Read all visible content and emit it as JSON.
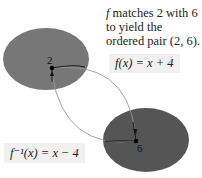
{
  "caption": {
    "f_symbol": "f",
    "text": " matches 2 with 6 to yield the ordered pair (2,  6)."
  },
  "formulas": {
    "f": "f(x) = x + 4",
    "f_inverse": "f⁻¹(x) = x − 4"
  },
  "domain_set": {
    "label": "2",
    "color": "#777777"
  },
  "range_set": {
    "label": "6",
    "color": "#555555"
  },
  "arrows": [
    {
      "from": "2",
      "to": "6",
      "meaning": "f"
    },
    {
      "from": "6",
      "to": "2",
      "meaning": "f inverse"
    }
  ],
  "colors": {
    "curve": "#999999",
    "arrow_short": "#111111"
  }
}
